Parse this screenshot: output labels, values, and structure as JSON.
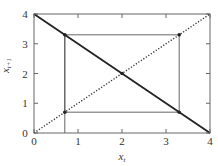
{
  "chart_data": {
    "type": "line",
    "title": "",
    "xlabel": "x_t",
    "ylabel": "x_{t+1}",
    "xlabel_main": "x",
    "xlabel_sub": "t",
    "ylabel_main": "x",
    "ylabel_sub": "t+1",
    "xlim": [
      0,
      4
    ],
    "ylim": [
      0,
      4
    ],
    "xticks": [
      0,
      1,
      2,
      3,
      4
    ],
    "yticks": [
      0,
      1,
      2,
      3,
      4
    ],
    "xtick_labels": [
      "0",
      "1",
      "2",
      "3",
      "4"
    ],
    "ytick_labels": [
      "0",
      "1",
      "2",
      "3",
      "4"
    ],
    "grid": false,
    "legend": null,
    "series": [
      {
        "name": "map x_{t+1} = 4 - x_t",
        "style": "solid-thick",
        "x": [
          0,
          4
        ],
        "y": [
          4,
          0
        ]
      },
      {
        "name": "identity x_{t+1} = x_t",
        "style": "dotted",
        "x": [
          0,
          4
        ],
        "y": [
          0,
          4
        ]
      },
      {
        "name": "cobweb trajectory",
        "style": "solid-thin",
        "x": [
          0.7,
          0.7,
          3.3,
          3.3,
          0.7,
          0.7
        ],
        "y": [
          0,
          3.3,
          3.3,
          0.7,
          0.7,
          3.3
        ]
      }
    ],
    "markers": [
      {
        "x": 0.7,
        "y": 3.3
      },
      {
        "x": 3.3,
        "y": 3.3
      },
      {
        "x": 3.3,
        "y": 0.7
      },
      {
        "x": 0.7,
        "y": 0.7
      },
      {
        "x": 2,
        "y": 2
      }
    ],
    "annotations": [
      "fixed point at (2, 2)",
      "period-2 cycle between 0.7 and 3.3"
    ]
  },
  "colors": {
    "frame": "#666666",
    "map_line": "#222222",
    "identity_line": "#333333",
    "cobweb": "#555555",
    "marker": "#222222",
    "text": "#333333"
  }
}
